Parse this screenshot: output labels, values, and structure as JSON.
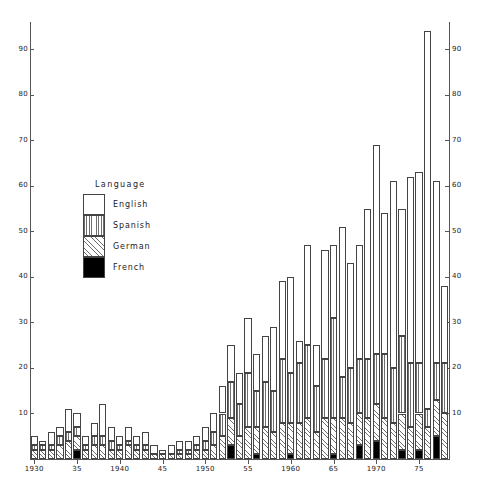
{
  "chart_data": {
    "type": "bar",
    "subtype": "stacked-bar",
    "title": "",
    "xlabel": "",
    "ylabel": "",
    "xlim": [
      1929.5,
      1978.5
    ],
    "ylim": [
      0,
      96
    ],
    "grid": false,
    "legend": {
      "title": "Language",
      "position": "inside-upper-left",
      "entries": [
        {
          "name": "English",
          "fill": "white",
          "pattern": "none"
        },
        {
          "name": "Spanish",
          "fill": "light-gray",
          "pattern": "vertical-lines"
        },
        {
          "name": "German",
          "fill": "hatch",
          "pattern": "cross-hatch"
        },
        {
          "name": "French",
          "fill": "black",
          "pattern": "solid"
        }
      ]
    },
    "yticks": [
      10,
      20,
      30,
      40,
      50,
      60,
      70,
      80,
      90
    ],
    "ytick_labels_left": [
      "10",
      "20",
      "30",
      "40",
      "50",
      "60",
      "70",
      "80",
      "90"
    ],
    "ytick_labels_right": [
      "10",
      "20",
      "30",
      "40",
      "50",
      "60",
      "70",
      "80",
      "90"
    ],
    "xticks": [
      1930,
      1935,
      1940,
      1945,
      1950,
      1955,
      1960,
      1965,
      1970,
      1975
    ],
    "xtick_labels": [
      "1930",
      "35",
      "1940",
      "45",
      "1950",
      "55",
      "1960",
      "65",
      "1970",
      "75"
    ],
    "categories": [
      1930,
      1931,
      1932,
      1933,
      1934,
      1935,
      1936,
      1937,
      1938,
      1939,
      1940,
      1941,
      1942,
      1943,
      1944,
      1945,
      1946,
      1947,
      1948,
      1949,
      1950,
      1951,
      1952,
      1953,
      1954,
      1955,
      1956,
      1957,
      1958,
      1959,
      1960,
      1961,
      1962,
      1963,
      1964,
      1965,
      1966,
      1967,
      1968,
      1969,
      1970,
      1971,
      1972,
      1973,
      1974,
      1975,
      1976,
      1977,
      1978
    ],
    "series": [
      {
        "name": "French",
        "values": [
          0,
          0,
          0,
          0,
          0,
          2,
          0,
          0,
          0,
          0,
          0,
          0,
          0,
          0,
          0,
          0,
          0,
          0,
          0,
          0,
          0,
          0,
          0,
          3,
          0,
          0,
          1,
          0,
          0,
          0,
          1,
          0,
          0,
          0,
          0,
          1,
          0,
          0,
          3,
          0,
          4,
          0,
          0,
          2,
          0,
          2,
          0,
          5,
          0
        ]
      },
      {
        "name": "German",
        "values": [
          2,
          2,
          2,
          3,
          4,
          3,
          2,
          3,
          3,
          2,
          2,
          3,
          2,
          2,
          1,
          1,
          1,
          1,
          1,
          2,
          2,
          3,
          5,
          6,
          5,
          7,
          6,
          7,
          6,
          8,
          7,
          8,
          9,
          6,
          9,
          8,
          9,
          8,
          7,
          9,
          8,
          9,
          8,
          8,
          7,
          8,
          7,
          8,
          10
        ]
      },
      {
        "name": "Spanish",
        "values": [
          1,
          1,
          1,
          2,
          2,
          2,
          1,
          2,
          2,
          2,
          1,
          1,
          1,
          1,
          0,
          0,
          0,
          1,
          1,
          1,
          2,
          3,
          5,
          8,
          7,
          12,
          8,
          10,
          9,
          14,
          11,
          13,
          16,
          10,
          13,
          22,
          9,
          12,
          12,
          13,
          11,
          14,
          12,
          17,
          14,
          11,
          4,
          8,
          11
        ]
      },
      {
        "name": "English",
        "values": [
          2,
          1,
          3,
          2,
          5,
          3,
          2,
          3,
          7,
          3,
          2,
          3,
          2,
          3,
          2,
          1,
          2,
          2,
          2,
          2,
          3,
          4,
          6,
          8,
          7,
          12,
          8,
          10,
          14,
          17,
          21,
          5,
          22,
          9,
          24,
          16,
          33,
          23,
          25,
          33,
          46,
          31,
          41,
          28,
          41,
          42,
          83,
          40,
          17
        ]
      }
    ],
    "totals": [
      5,
      4,
      6,
      7,
      11,
      10,
      5,
      8,
      12,
      7,
      5,
      7,
      5,
      6,
      3,
      2,
      3,
      4,
      4,
      5,
      7,
      10,
      16,
      25,
      19,
      31,
      23,
      27,
      29,
      39,
      40,
      26,
      47,
      25,
      46,
      47,
      51,
      43,
      47,
      55,
      69,
      54,
      61,
      55,
      62,
      63,
      94,
      61,
      38
    ]
  }
}
